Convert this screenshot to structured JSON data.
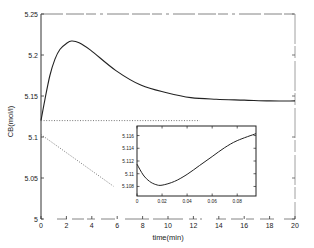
{
  "chart_data": [
    {
      "type": "line",
      "title": "",
      "xlabel": "time(min)",
      "ylabel": "CB(mol/l)",
      "xlim": [
        0,
        20
      ],
      "ylim": [
        5,
        5.25
      ],
      "grid": false,
      "legend": null,
      "x_ticks": [
        0,
        2,
        4,
        6,
        8,
        10,
        12,
        14,
        16,
        18,
        20
      ],
      "y_ticks": [
        5,
        5.05,
        5.1,
        5.15,
        5.2,
        5.25
      ],
      "x_tick_labels": [
        "0",
        "2",
        "4",
        "6",
        "8",
        "10",
        "12",
        "14",
        "16",
        "18",
        "20"
      ],
      "y_tick_labels": [
        "5",
        "5.05",
        "5.1",
        "5.15",
        "5.2",
        "5.25"
      ],
      "series": [
        {
          "name": "CB response",
          "style": "solid",
          "x": [
            0,
            0.3,
            0.7,
            1.1,
            1.5,
            2.0,
            2.4,
            3.0,
            3.9,
            5.9,
            7.9,
            9.9,
            11.8,
            13.8,
            16.0,
            18.0,
            20.0
          ],
          "y": [
            5.12,
            5.145,
            5.175,
            5.195,
            5.207,
            5.214,
            5.217,
            5.215,
            5.206,
            5.181,
            5.163,
            5.154,
            5.148,
            5.146,
            5.145,
            5.144,
            5.144
          ]
        },
        {
          "name": "reference level",
          "style": "dotted",
          "x": [
            0,
            12.5
          ],
          "y": [
            5.12,
            5.12
          ]
        },
        {
          "name": "initial slope",
          "style": "dotted",
          "x": [
            0,
            5.7
          ],
          "y": [
            5.103,
            5.04
          ]
        }
      ],
      "annotations": []
    },
    {
      "type": "line",
      "title": "",
      "description": "inset zoom of initial transient",
      "xlabel": "",
      "ylabel": "",
      "xlim": [
        0,
        0.095
      ],
      "ylim": [
        5.1065,
        5.1175
      ],
      "grid": false,
      "x_ticks": [
        0,
        0.02,
        0.04,
        0.06,
        0.08
      ],
      "y_ticks": [
        5.108,
        5.11,
        5.112,
        5.114,
        5.116
      ],
      "x_tick_labels": [
        "0",
        "0.02",
        "0.04",
        "0.06",
        "0.08"
      ],
      "y_tick_labels": [
        "5.108",
        "5.11",
        "5.112",
        "5.114",
        "5.116"
      ],
      "series": [
        {
          "name": "CB inset",
          "style": "solid",
          "x": [
            0,
            0.005,
            0.01,
            0.015,
            0.02,
            0.03,
            0.04,
            0.05,
            0.06,
            0.07,
            0.08,
            0.095
          ],
          "y": [
            5.1115,
            5.1098,
            5.1088,
            5.1083,
            5.1082,
            5.1088,
            5.1099,
            5.1113,
            5.1127,
            5.1141,
            5.1152,
            5.1163
          ]
        }
      ]
    }
  ]
}
